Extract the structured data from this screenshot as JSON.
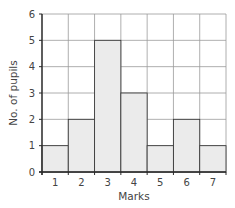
{
  "chart_data": {
    "type": "bar",
    "subtype": "histogram",
    "title": "",
    "xlabel": "Marks",
    "ylabel": "No. of pupils",
    "categories": [
      "1",
      "2",
      "3",
      "4",
      "5",
      "6",
      "7"
    ],
    "values": [
      1,
      2,
      5,
      3,
      1,
      2,
      1
    ],
    "ylim": [
      0,
      6
    ],
    "yticks": [
      0,
      1,
      2,
      3,
      4,
      5,
      6
    ],
    "grid": true,
    "legend": null,
    "colors": {
      "bar_fill": "#ebebeb",
      "bar_stroke": "#3a3a3a",
      "grid": "#9a9a9a",
      "axis": "#2a2a2a"
    }
  }
}
